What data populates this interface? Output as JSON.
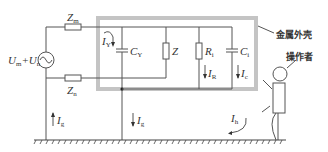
{
  "diagram": {
    "type": "circuit",
    "labels": {
      "source": {
        "main1": "U",
        "sub1": "m",
        "plus": "+",
        "main2": "U",
        "sub2": "n"
      },
      "zm": {
        "main": "Z",
        "sub": "m"
      },
      "zn": {
        "main": "Z",
        "sub": "n"
      },
      "iy": {
        "main": "I",
        "sub": "Y"
      },
      "cy": {
        "main": "C",
        "sub": "Y"
      },
      "z": {
        "main": "Z"
      },
      "ri": {
        "main": "R",
        "sub": "i"
      },
      "ir": {
        "main": "I",
        "sub": "R"
      },
      "ci": {
        "main": "C",
        "sub": "i"
      },
      "ic": {
        "main": "I",
        "sub": "c"
      },
      "ig_left": {
        "main": "I",
        "sub": "g"
      },
      "ig_mid": {
        "main": "I",
        "sub": "g"
      },
      "ih": {
        "main": "I",
        "sub": "h"
      },
      "housing": "金属外壳",
      "operator": "操作者"
    },
    "colors": {
      "wire": "#555555",
      "housing": "#c4c4c4"
    }
  }
}
